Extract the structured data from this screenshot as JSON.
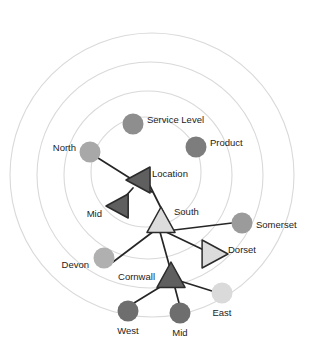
{
  "diagram": {
    "type": "radial-network",
    "canvas": {
      "width": 316,
      "height": 352,
      "background": "#ffffff"
    },
    "palette": {
      "ring_stroke": "#d9d9d9",
      "edge_stroke": "#262626",
      "label_color": "#1c1c1c",
      "node_mid_gray": "#8e8e8e",
      "node_dark_gray": "#6e6e6e",
      "node_light_gray": "#b3b3b3",
      "node_pale_gray": "#d6d6d6",
      "triangle_dark_fill": "#5f5f5f",
      "triangle_light_fill": "#dcdcdc",
      "triangle_stroke": "#2b2b2b"
    },
    "rings": [
      {
        "name": "ring-outer",
        "cx": 152,
        "cy": 175,
        "r": 142
      },
      {
        "name": "ring-third",
        "cx": 150,
        "cy": 175,
        "r": 113
      },
      {
        "name": "ring-second",
        "cx": 148,
        "cy": 175,
        "r": 84
      },
      {
        "name": "ring-inner",
        "cx": 146,
        "cy": 172,
        "r": 55
      }
    ],
    "nodes": [
      {
        "id": "service-level",
        "label": "Service Level",
        "shape": "circle",
        "x": 133,
        "y": 124,
        "r": 10.5,
        "color": "#8e8e8e",
        "label_x": 147,
        "label_y": 120,
        "label_anchor": "start"
      },
      {
        "id": "product",
        "label": "Product",
        "shape": "circle",
        "x": 196,
        "y": 147,
        "r": 10.5,
        "color": "#7d7d7d",
        "label_x": 210,
        "label_y": 143,
        "label_anchor": "start"
      },
      {
        "id": "north",
        "label": "North",
        "shape": "circle",
        "x": 90,
        "y": 152,
        "r": 10.5,
        "color": "#a8a8a8",
        "label_x": 76,
        "label_y": 148,
        "label_anchor": "end"
      },
      {
        "id": "location",
        "label": "Location",
        "shape": "triangle-left",
        "x": 139,
        "y": 180,
        "size": 13,
        "color": "#5f5f5f",
        "outlined": true,
        "label_x": 152,
        "label_y": 174,
        "label_anchor": "start"
      },
      {
        "id": "mid-upper",
        "label": "Mid",
        "shape": "triangle-left",
        "x": 118,
        "y": 206,
        "size": 12,
        "color": "#5f5f5f",
        "outlined": true,
        "label_x": 102,
        "label_y": 214,
        "label_anchor": "end"
      },
      {
        "id": "south",
        "label": "South",
        "shape": "triangle-up",
        "x": 161,
        "y": 221,
        "size": 14,
        "color": "#dcdcdc",
        "outlined": true,
        "label_x": 174,
        "label_y": 212,
        "label_anchor": "start"
      },
      {
        "id": "somerset",
        "label": "Somerset",
        "shape": "circle",
        "x": 242,
        "y": 223,
        "r": 10.5,
        "color": "#9b9b9b",
        "label_x": 256,
        "label_y": 225,
        "label_anchor": "start"
      },
      {
        "id": "dorset",
        "label": "Dorset",
        "shape": "triangle-right",
        "x": 214,
        "y": 254,
        "size": 14,
        "color": "#dcdcdc",
        "outlined": true,
        "label_x": 228,
        "label_y": 250,
        "label_anchor": "start"
      },
      {
        "id": "devon",
        "label": "Devon",
        "shape": "circle",
        "x": 104,
        "y": 258,
        "r": 10.5,
        "color": "#b0b0b0",
        "label_x": 89,
        "label_y": 265,
        "label_anchor": "end"
      },
      {
        "id": "cornwall",
        "label": "Cornwall",
        "shape": "triangle-up",
        "x": 171,
        "y": 276,
        "size": 14,
        "color": "#5f5f5f",
        "outlined": true,
        "label_x": 155,
        "label_y": 277,
        "label_anchor": "end"
      },
      {
        "id": "east",
        "label": "East",
        "shape": "circle",
        "x": 222,
        "y": 293,
        "r": 10.5,
        "color": "#dadada",
        "label_x": 222,
        "label_y": 313,
        "label_anchor": "middle"
      },
      {
        "id": "west",
        "label": "West",
        "shape": "circle",
        "x": 128,
        "y": 311,
        "r": 10.5,
        "color": "#6e6e6e",
        "label_x": 128,
        "label_y": 331,
        "label_anchor": "middle"
      },
      {
        "id": "mid-lower",
        "label": "Mid",
        "shape": "circle",
        "x": 180,
        "y": 313,
        "r": 10.5,
        "color": "#6e6e6e",
        "label_x": 180,
        "label_y": 333,
        "label_anchor": "middle"
      }
    ],
    "edges": [
      {
        "from": "north",
        "to": "location",
        "x1": 98,
        "y1": 158,
        "x2": 152,
        "y2": 192
      },
      {
        "from": "location",
        "to": "mid-upper",
        "x1": 133,
        "y1": 188,
        "x2": 124,
        "y2": 198
      },
      {
        "from": "location",
        "to": "south",
        "x1": 150,
        "y1": 186,
        "x2": 163,
        "y2": 212
      },
      {
        "from": "south",
        "to": "somerset",
        "x1": 166,
        "y1": 231,
        "x2": 232,
        "y2": 223
      },
      {
        "from": "south",
        "to": "dorset",
        "x1": 164,
        "y1": 231,
        "x2": 208,
        "y2": 252
      },
      {
        "from": "south",
        "to": "devon",
        "x1": 154,
        "y1": 231,
        "x2": 113,
        "y2": 262
      },
      {
        "from": "south",
        "to": "cornwall",
        "x1": 160,
        "y1": 232,
        "x2": 170,
        "y2": 268
      },
      {
        "from": "cornwall",
        "to": "west",
        "x1": 165,
        "y1": 284,
        "x2": 134,
        "y2": 303
      },
      {
        "from": "cornwall",
        "to": "mid-lower",
        "x1": 174,
        "y1": 284,
        "x2": 179,
        "y2": 303
      },
      {
        "from": "cornwall",
        "to": "east",
        "x1": 180,
        "y1": 281,
        "x2": 212,
        "y2": 291
      }
    ]
  }
}
